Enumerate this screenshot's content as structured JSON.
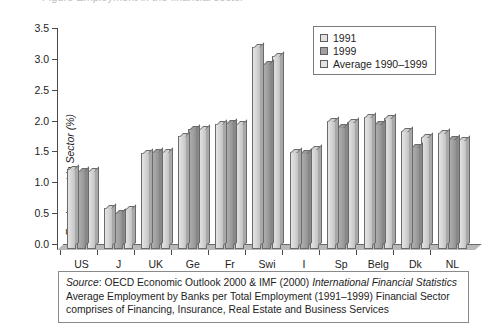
{
  "figure": {
    "cut_off_title": "Figure  Employment in the financial sector",
    "axis_title_y": "Employment in Sector (%)",
    "footnote": {
      "source_label": "Source",
      "source_sep": ":",
      "source_text": "OECD Economic Outlook 2000 & IMF (2000)",
      "source_italic_tail": "International Financial Statistics",
      "line2": "Average Employment by Banks per Total Employment (1991–1999) Financial Sector",
      "line3": "comprises of Financing, Insurance, Real Estate and Business Services"
    }
  },
  "legend": {
    "position": "top-right",
    "entries": [
      {
        "label": "1991",
        "color": "#e2e2e2"
      },
      {
        "label": "1999",
        "color": "#a0a0a0"
      },
      {
        "label": "Average 1990–1999",
        "color": "#e2e2e2"
      }
    ]
  },
  "chart_data": {
    "type": "bar",
    "title": "",
    "xlabel": "",
    "ylabel": "Employment in Sector (%)",
    "ylim": [
      0.0,
      3.5
    ],
    "ytick_step": 0.5,
    "ytick_labels": [
      "0.0",
      "0.5",
      "1.0",
      "1.5",
      "2.0",
      "2.5",
      "3.0",
      "3.5"
    ],
    "grid": false,
    "legend_position": "top-right",
    "categories": [
      "US",
      "J",
      "UK",
      "Ge",
      "Fr",
      "Swi",
      "I",
      "Sp",
      "Belg",
      "Dk",
      "NL"
    ],
    "series": [
      {
        "name": "1991",
        "color": "#e2e2e2",
        "values": [
          1.29,
          0.67,
          1.56,
          1.83,
          2.03,
          3.27,
          1.58,
          2.07,
          2.14,
          1.92,
          1.88
        ]
      },
      {
        "name": "1999",
        "color": "#a0a0a0",
        "values": [
          1.27,
          0.58,
          1.57,
          1.95,
          2.04,
          3.0,
          1.56,
          1.97,
          2.02,
          1.65,
          1.78
        ]
      },
      {
        "name": "Average 1990–1999",
        "color": "#e2e2e2",
        "values": [
          1.26,
          0.65,
          1.57,
          1.95,
          2.03,
          3.12,
          1.62,
          2.06,
          2.12,
          1.82,
          1.77
        ]
      }
    ]
  }
}
